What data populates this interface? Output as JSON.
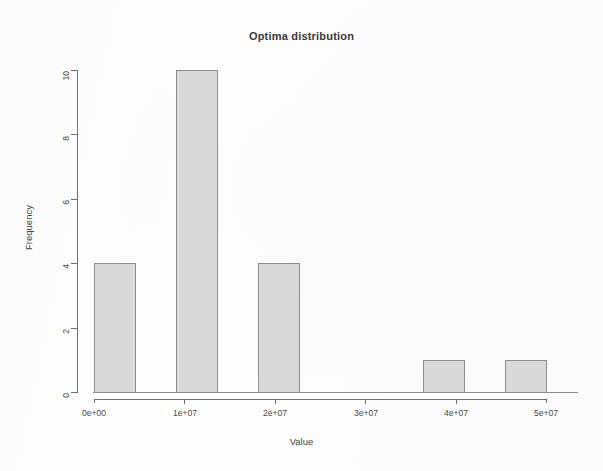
{
  "chart_data": {
    "type": "bar",
    "title": "Optima distribution",
    "xlabel": "Value",
    "ylabel": "Frequency",
    "grid": false,
    "legend": null,
    "xlim": [
      0,
      55000000
    ],
    "ylim": [
      0,
      10
    ],
    "bin_width": 5000000,
    "x_ticks": [
      0,
      10000000,
      20000000,
      30000000,
      40000000,
      50000000
    ],
    "x_tick_labels": [
      "0e+00",
      "1e+07",
      "2e+07",
      "3e+07",
      "4e+07",
      "5e+07"
    ],
    "y_ticks": [
      0,
      2,
      4,
      6,
      8,
      10
    ],
    "y_tick_labels": [
      "0",
      "2",
      "4",
      "6",
      "8",
      "10"
    ],
    "bins": [
      {
        "x0": 0,
        "x1": 5000000,
        "value": 4
      },
      {
        "x0": 5000000,
        "x1": 10000000,
        "value": 0
      },
      {
        "x0": 10000000,
        "x1": 15000000,
        "value": 10
      },
      {
        "x0": 15000000,
        "x1": 20000000,
        "value": 0
      },
      {
        "x0": 20000000,
        "x1": 25000000,
        "value": 4
      },
      {
        "x0": 25000000,
        "x1": 30000000,
        "value": 0
      },
      {
        "x0": 30000000,
        "x1": 35000000,
        "value": 0
      },
      {
        "x0": 35000000,
        "x1": 40000000,
        "value": 0
      },
      {
        "x0": 40000000,
        "x1": 45000000,
        "value": 1
      },
      {
        "x0": 45000000,
        "x1": 50000000,
        "value": 0
      },
      {
        "x0": 50000000,
        "x1": 55000000,
        "value": 1
      }
    ],
    "categories": [
      "0e+00",
      "1e+07",
      "2e+07",
      "3e+07",
      "4e+07",
      "5e+07"
    ],
    "values": [
      4,
      10,
      4,
      0,
      1,
      1
    ],
    "colors": {
      "bar_fill": "#d9d9d9",
      "bar_stroke": "#8d8d8d",
      "axis": "#6f6f6f",
      "text": "#3a3a3a",
      "background": "#ffffff"
    }
  }
}
